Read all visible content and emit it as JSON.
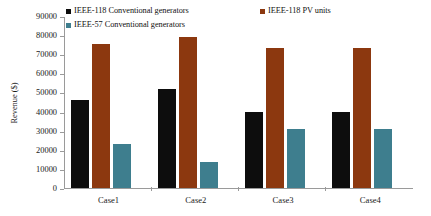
{
  "chart_data": {
    "type": "bar",
    "title": "",
    "subtitle": "",
    "xlabel": "",
    "ylabel": "Revenue ($)",
    "categories": [
      "Case1",
      "Case2",
      "Case3",
      "Case4"
    ],
    "series": [
      {
        "name": "IEEE-118 Conventional generators",
        "color": "#0d0d0d",
        "values": [
          46000,
          52000,
          40000,
          40000
        ]
      },
      {
        "name": "IEEE-118 PV units",
        "color": "#8c380f",
        "values": [
          75500,
          79000,
          73500,
          73300
        ]
      },
      {
        "name": "IEEE-57 Conventional generators",
        "color": "#3e7e8e",
        "values": [
          23000,
          13500,
          31000,
          30800
        ]
      }
    ],
    "ylim": [
      0,
      90000
    ],
    "yticks": [
      0,
      10000,
      20000,
      30000,
      40000,
      50000,
      60000,
      70000,
      80000,
      90000
    ],
    "ytick_labels": [
      "0",
      "10000",
      "20000",
      "30000",
      "40000",
      "50000",
      "60000",
      "70000",
      "80000",
      "90000"
    ],
    "grid": false,
    "legend_position": "top",
    "legend_entries": [
      "IEEE-118 Conventional generators",
      "IEEE-118 PV units",
      "IEEE-57 Conventional generators"
    ],
    "legend_layout": [
      {
        "entry_index": 0,
        "slot": 0
      },
      {
        "entry_index": 1,
        "slot": 1
      },
      {
        "entry_index": 2,
        "slot": 2
      }
    ],
    "annotations": []
  },
  "colors": {
    "background": "#ffffff",
    "axis": "#9a9a9a",
    "text": "#1a1a1a",
    "series_black": "#0d0d0d",
    "series_brown": "#8c380f",
    "series_teal": "#3e7e8e"
  }
}
